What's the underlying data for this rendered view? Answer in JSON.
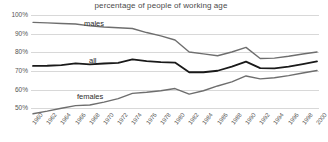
{
  "chart_data": {
    "type": "line",
    "title": "percentage of people of working age",
    "xlabel": "",
    "ylabel": "",
    "grid": true,
    "legend_position": "inline-labels",
    "x": [
      1960,
      1962,
      1964,
      1966,
      1968,
      1970,
      1972,
      1974,
      1976,
      1978,
      1980,
      1982,
      1984,
      1986,
      1988,
      1990,
      1992,
      1994,
      1996,
      1998,
      2000
    ],
    "x_tick_labels": [
      "1960",
      "1962",
      "1964",
      "1966",
      "1968",
      "1970",
      "1972",
      "1974",
      "1976",
      "1978",
      "1980",
      "1982",
      "1984",
      "1986",
      "1988",
      "1990",
      "1992",
      "1994",
      "1996",
      "1998",
      "2000"
    ],
    "xlim": [
      1960,
      2000
    ],
    "ylim": [
      46,
      101
    ],
    "y_ticks": [
      50,
      60,
      70,
      80,
      90,
      100
    ],
    "y_tick_labels": [
      "50%",
      "60%",
      "70%",
      "80%",
      "90%",
      "100%"
    ],
    "series": [
      {
        "name": "males",
        "color": "#6e6e6e",
        "values": [
          96.5,
          96.2,
          95.9,
          95.6,
          94.6,
          94.0,
          93.6,
          93.2,
          91.0,
          89.2,
          87.0,
          80.5,
          79.5,
          78.5,
          80.5,
          83.0,
          77.0,
          77.2,
          78.2,
          79.4,
          80.5
        ]
      },
      {
        "name": "all",
        "color": "#1a1a1a",
        "values": [
          73.0,
          73.1,
          73.4,
          74.4,
          73.8,
          74.3,
          74.6,
          76.5,
          75.6,
          75.0,
          74.8,
          69.6,
          69.6,
          70.4,
          72.6,
          75.3,
          71.8,
          71.7,
          72.6,
          74.0,
          75.4
        ]
      },
      {
        "name": "females",
        "color": "#6e6e6e",
        "values": [
          47.2,
          48.6,
          50.2,
          51.6,
          51.9,
          53.5,
          55.4,
          58.2,
          58.8,
          59.6,
          60.8,
          57.8,
          59.6,
          62.2,
          64.4,
          67.6,
          66.0,
          66.6,
          67.8,
          69.2,
          70.5
        ]
      }
    ],
    "series_inline_labels": [
      {
        "name": "males",
        "text": "males"
      },
      {
        "name": "all",
        "text": "all"
      },
      {
        "name": "females",
        "text": "females"
      }
    ]
  },
  "style": {
    "background": "#ffffff",
    "grid_color": "#d8d8d8",
    "axis_color": "#9a9a9a",
    "title_color": "#4a4a4a",
    "tick_color": "#555555"
  }
}
